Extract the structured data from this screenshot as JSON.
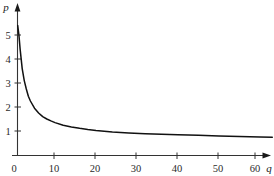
{
  "figure": {
    "background": "#ffffff",
    "curve_color": "#111111",
    "axis_color": "#333333"
  },
  "chart_data": {
    "type": "line",
    "title": "",
    "subtitle": "",
    "xlabel": "q",
    "ylabel": "p",
    "xlim": [
      0,
      64
    ],
    "ylim": [
      0,
      5.6
    ],
    "grid": false,
    "legend": null,
    "annotations": [],
    "xticks": [
      0,
      10,
      20,
      30,
      40,
      50,
      60
    ],
    "xtick_labels": [
      "0",
      "10",
      "20",
      "30",
      "40",
      "50",
      "60"
    ],
    "yticks": [
      1,
      2,
      3,
      4,
      5
    ],
    "ytick_labels": [
      "1",
      "2",
      "3",
      "4",
      "5"
    ],
    "series": [
      {
        "name": "demand curve",
        "relation": "p = 50 / q",
        "x": [
          0.9,
          1.2,
          1.5,
          2.0,
          2.5,
          3.0,
          3.5,
          4.0,
          5.0,
          6.0,
          7.0,
          8.0,
          9.0,
          10.0,
          12.0,
          14.0,
          16.0,
          18.0,
          20.0,
          24.0,
          28.0,
          32.0,
          36.0,
          40.0,
          45.0,
          50.0,
          55.0,
          60.0,
          63.0
        ],
        "y": [
          5.4,
          5.0,
          4.4,
          3.6,
          3.1,
          2.75,
          2.45,
          2.25,
          1.95,
          1.75,
          1.6,
          1.5,
          1.42,
          1.35,
          1.24,
          1.17,
          1.11,
          1.06,
          1.02,
          0.96,
          0.92,
          0.89,
          0.86,
          0.84,
          0.82,
          0.79,
          0.77,
          0.75,
          0.74
        ]
      }
    ]
  },
  "axis_arrows": {
    "x_arrow": "arrow-right",
    "y_arrow": "arrow-up"
  }
}
